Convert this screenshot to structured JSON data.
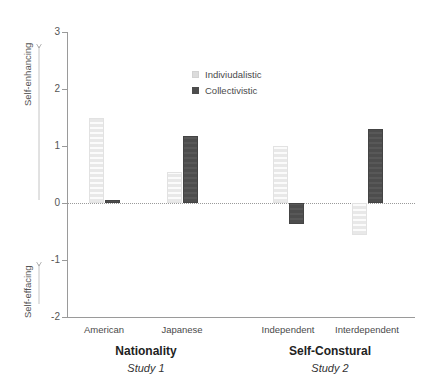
{
  "chart_data": {
    "type": "bar",
    "title": "",
    "xlabel": "",
    "ylabel": "",
    "ylim": [
      -2,
      3
    ],
    "yticks": [
      "3",
      "2",
      "1",
      "0",
      "-1",
      "-2"
    ],
    "ytick_values": [
      3,
      2,
      1,
      0,
      -1,
      -2
    ],
    "grid": false,
    "zero_line": true,
    "legend_position": "top-center",
    "axis_annotations": {
      "positive_direction": "Self-enhancing",
      "negative_direction": "Self-effacing"
    },
    "categories": [
      "American",
      "Japanese",
      "Independent",
      "Interdependent"
    ],
    "series": [
      {
        "name": "Indiviudalistic",
        "color": "#e8e8e8",
        "values": [
          1.49,
          0.55,
          1.0,
          -0.56
        ]
      },
      {
        "name": "Collectivistic",
        "color": "#4d4d4d",
        "values": [
          0.05,
          1.18,
          -0.37,
          1.3
        ]
      }
    ],
    "groups": [
      {
        "title": "Nationality",
        "subtitle": "Study 1",
        "categories": [
          "American",
          "Japanese"
        ]
      },
      {
        "title": "Self-Constural",
        "subtitle": "Study 2",
        "categories": [
          "Independent",
          "Interdependent"
        ]
      }
    ]
  },
  "legend": {
    "items": [
      {
        "label": "Indiviudalistic",
        "swatch": "light"
      },
      {
        "label": "Collectivistic",
        "swatch": "dark"
      }
    ]
  },
  "yaxis": {
    "ticks": [
      {
        "label": "3"
      },
      {
        "label": "2"
      },
      {
        "label": "1"
      },
      {
        "label": "0"
      },
      {
        "label": "-1"
      },
      {
        "label": "-2"
      }
    ],
    "top_annotation": "Self-enhancing",
    "bottom_annotation": "Self-effacing"
  },
  "xaxis": {
    "categories": [
      {
        "label": "American"
      },
      {
        "label": "Japanese"
      },
      {
        "label": "Independent"
      },
      {
        "label": "Interdependent"
      }
    ],
    "groups": [
      {
        "title": "Nationality",
        "subtitle": "Study 1"
      },
      {
        "title": "Self-Constural",
        "subtitle": "Study 2"
      }
    ]
  },
  "colors": {
    "light_series": "#e8e8e8",
    "dark_series": "#4d4d4d",
    "axis": "#9a9a9a",
    "text": "#4a4a4a"
  }
}
